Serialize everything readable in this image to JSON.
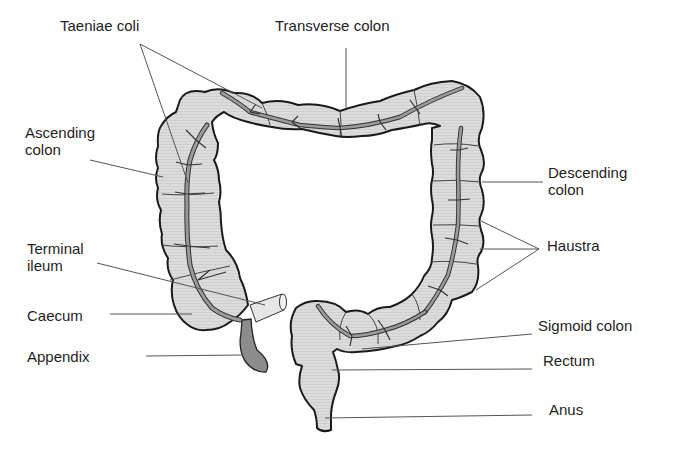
{
  "diagram": {
    "colors": {
      "organ_fill": "#d9d9d9",
      "organ_outline": "#1a1a1a",
      "taenia_fill": "#9a9a9a",
      "appendix_fill": "#8c8c8c",
      "leader_line": "#555555",
      "text": "#1e1e1e"
    },
    "labels": [
      {
        "id": "taeniae-coli",
        "text": "Taeniae coli",
        "x": 60,
        "y": 17
      },
      {
        "id": "transverse-colon",
        "text": "Transverse colon",
        "x": 275,
        "y": 17
      },
      {
        "id": "ascending-colon",
        "text": "Ascending\ncolon",
        "x": 25,
        "y": 124
      },
      {
        "id": "descending-colon",
        "text": "Descending\ncolon",
        "x": 548,
        "y": 164
      },
      {
        "id": "haustra",
        "text": "Haustra",
        "x": 547,
        "y": 237
      },
      {
        "id": "terminal-ileum",
        "text": "Terminal\nileum",
        "x": 27,
        "y": 240
      },
      {
        "id": "caecum",
        "text": "Caecum",
        "x": 27,
        "y": 307
      },
      {
        "id": "appendix",
        "text": "Appendix",
        "x": 27,
        "y": 348
      },
      {
        "id": "sigmoid-colon",
        "text": "Sigmoid colon",
        "x": 538,
        "y": 317
      },
      {
        "id": "rectum",
        "text": "Rectum",
        "x": 543,
        "y": 352
      },
      {
        "id": "anus",
        "text": "Anus",
        "x": 549,
        "y": 401
      }
    ]
  }
}
